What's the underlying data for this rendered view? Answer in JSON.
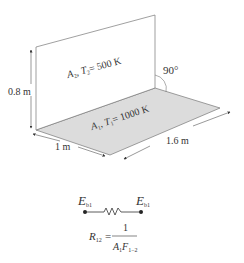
{
  "diagram": {
    "vertical_plate": {
      "label_A": "A",
      "label_A_sub": "2",
      "label_T": "T",
      "label_T_sub": "2",
      "label_value": "= 500 K"
    },
    "horizontal_plate": {
      "label_A": "A",
      "label_A_sub": "1",
      "label_T": "T",
      "label_T_sub": "1",
      "label_value": "= 1000 K"
    },
    "angle_label": "90°",
    "height_label": "0.8 m",
    "width_label": "1 m",
    "length_label": "1.6 m",
    "circuit": {
      "left_node": "E",
      "left_node_sub": "b1",
      "right_node": "E",
      "right_node_sub": "b1",
      "resistance_symbol": "R",
      "resistance_sub": "12",
      "equals": "=",
      "numerator": "1",
      "denominator_A": "A",
      "denominator_A_sub": "1",
      "denominator_F": "F",
      "denominator_F_sub": "1−2"
    },
    "colors": {
      "floor_fill": "#d9d9d9",
      "line": "#666666"
    }
  }
}
